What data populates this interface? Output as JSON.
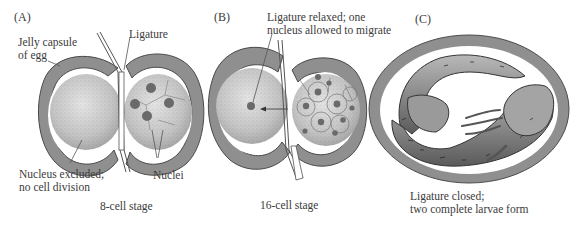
{
  "figure": {
    "panels": [
      {
        "id": "A",
        "label": "(A)",
        "stage": "8-cell stage",
        "annotations": {
          "jelly_capsule_line1": "Jelly capsule",
          "jelly_capsule_line2": "of egg",
          "ligature": "Ligature",
          "nucleus_excluded_line1": "Nucleus excluded;",
          "nucleus_excluded_line2": "no cell division",
          "nuclei": "Nuclei"
        }
      },
      {
        "id": "B",
        "label": "(B)",
        "stage": "16-cell stage",
        "annotations": {
          "ligature_relaxed_line1": "Ligature relaxed; one",
          "ligature_relaxed_line2": "nucleus allowed to migrate"
        }
      },
      {
        "id": "C",
        "label": "(C)",
        "annotations": {
          "result_line1": "Ligature closed;",
          "result_line2": "two complete larvae form"
        }
      }
    ],
    "colors": {
      "capsule": "#8f8f8f",
      "capsule_outline": "#4a4a4a",
      "cytoplasm": "#c9c9c9",
      "nucleus": "#6a6a6a",
      "text": "#3b3b3b"
    }
  }
}
